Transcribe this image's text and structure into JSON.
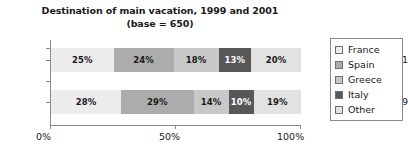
{
  "chart_data": {
    "type": "bar",
    "orientation": "horizontal",
    "stacked": true,
    "normalized": true,
    "title": "Destination of main vacation, 1999 and 2001",
    "subtitle": "(base = 650)",
    "title_lines": [
      "Destination of main vacation, 1999 and 2001",
      "(base = 650)"
    ],
    "xlabel": "",
    "ylabel": "",
    "categories": [
      "2001",
      "1999"
    ],
    "xlim": [
      0,
      100
    ],
    "xticks": [
      0,
      50,
      100
    ],
    "xtick_labels": [
      "0%",
      "50%",
      "100%"
    ],
    "grid": false,
    "legend_position": "right",
    "series": [
      {
        "name": "France",
        "color": "#ECECEC",
        "values": [
          25,
          28
        ],
        "labels": [
          "25%",
          "28%"
        ]
      },
      {
        "name": "Spain",
        "color": "#ACACAC",
        "values": [
          24,
          29
        ],
        "labels": [
          "24%",
          "29%"
        ]
      },
      {
        "name": "Greece",
        "color": "#C8C8C8",
        "values": [
          18,
          14
        ],
        "labels": [
          "18%",
          "14%"
        ]
      },
      {
        "name": "Italy",
        "color": "#575757",
        "values": [
          13,
          10
        ],
        "labels": [
          "13%",
          "10%"
        ]
      },
      {
        "name": "Other",
        "color": "#E2E2E2",
        "values": [
          20,
          19
        ],
        "labels": [
          "20%",
          "19%"
        ]
      }
    ],
    "rows": [
      {
        "category": "2001",
        "segments": [
          {
            "name": "France",
            "value": 25,
            "label": "25%",
            "color": "#ECECEC",
            "text_color": "#1a1a1a"
          },
          {
            "name": "Spain",
            "value": 24,
            "label": "24%",
            "color": "#ACACAC",
            "text_color": "#1a1a1a"
          },
          {
            "name": "Greece",
            "value": 18,
            "label": "18%",
            "color": "#C8C8C8",
            "text_color": "#1a1a1a"
          },
          {
            "name": "Italy",
            "value": 13,
            "label": "13%",
            "color": "#575757",
            "text_color": "#ffffff"
          },
          {
            "name": "Other",
            "value": 20,
            "label": "20%",
            "color": "#E2E2E2",
            "text_color": "#1a1a1a"
          }
        ]
      },
      {
        "category": "1999",
        "segments": [
          {
            "name": "France",
            "value": 28,
            "label": "28%",
            "color": "#ECECEC",
            "text_color": "#1a1a1a"
          },
          {
            "name": "Spain",
            "value": 29,
            "label": "29%",
            "color": "#ACACAC",
            "text_color": "#1a1a1a"
          },
          {
            "name": "Greece",
            "value": 14,
            "label": "14%",
            "color": "#C8C8C8",
            "text_color": "#1a1a1a"
          },
          {
            "name": "Italy",
            "value": 10,
            "label": "10%",
            "color": "#575757",
            "text_color": "#ffffff"
          },
          {
            "name": "Other",
            "value": 19,
            "label": "19%",
            "color": "#E2E2E2",
            "text_color": "#1a1a1a"
          }
        ]
      }
    ]
  },
  "axis": {
    "x_tick_labels": [
      "0%",
      "50%",
      "100%"
    ],
    "y_tick_labels": [
      "2001",
      "1999"
    ],
    "axis_color": "#8a8a8a"
  },
  "legend": {
    "items": [
      {
        "label": "France",
        "color": "#ECECEC"
      },
      {
        "label": "Spain",
        "color": "#ACACAC"
      },
      {
        "label": "Greece",
        "color": "#C8C8C8"
      },
      {
        "label": "Italy",
        "color": "#575757"
      },
      {
        "label": "Other",
        "color": "#E2E2E2"
      }
    ]
  }
}
